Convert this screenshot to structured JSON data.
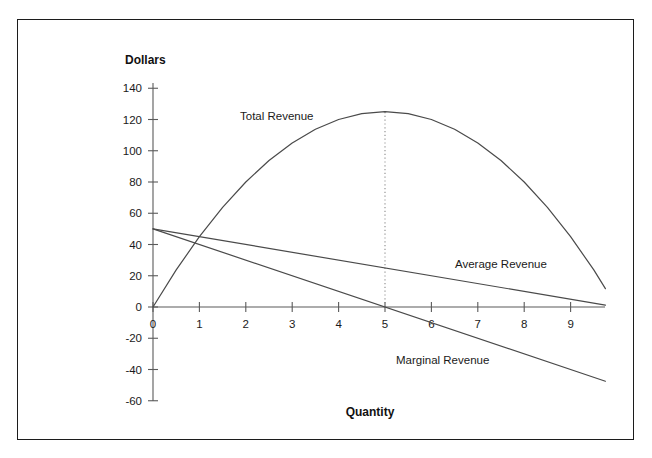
{
  "chart_data": {
    "type": "line",
    "title": "",
    "xlabel": "Quantity",
    "ylabel": "Dollars",
    "xlim": [
      0,
      9.75
    ],
    "ylim": [
      -60,
      140
    ],
    "grid": false,
    "legend_position": "inline-labels",
    "x_ticks": [
      "0",
      "1",
      "2",
      "3",
      "4",
      "5",
      "6",
      "7",
      "8",
      "9"
    ],
    "x_tick_values": [
      0,
      1,
      2,
      3,
      4,
      5,
      6,
      7,
      8,
      9
    ],
    "y_ticks": [
      "-60",
      "-40",
      "-20",
      "0",
      "20",
      "40",
      "60",
      "80",
      "100",
      "120",
      "140"
    ],
    "y_tick_values": [
      -60,
      -40,
      -20,
      0,
      20,
      40,
      60,
      80,
      100,
      120,
      140
    ],
    "series": [
      {
        "name": "Total Revenue",
        "label": "Total Revenue",
        "formula": "TR = 50Q - 5Q^2",
        "x": [
          0,
          0.5,
          1,
          1.5,
          2,
          2.5,
          3,
          3.5,
          4,
          4.5,
          5,
          5.5,
          6,
          6.5,
          7,
          7.5,
          8,
          8.5,
          9,
          9.5,
          9.75
        ],
        "values": [
          0,
          23.75,
          45,
          63.75,
          80,
          93.75,
          105,
          113.75,
          120,
          123.75,
          125,
          123.75,
          120,
          113.75,
          105,
          93.75,
          80,
          63.75,
          45,
          23.75,
          11.72
        ]
      },
      {
        "name": "Average Revenue",
        "label": "Average Revenue",
        "formula": "AR = 50 - 5Q",
        "x": [
          0,
          9.75
        ],
        "values": [
          50,
          1.25
        ]
      },
      {
        "name": "Marginal Revenue",
        "label": "Marginal Revenue",
        "formula": "MR = 50 - 10Q",
        "x": [
          0,
          9.75
        ],
        "values": [
          50,
          -47.5
        ]
      }
    ],
    "annotations": [
      {
        "name": "peak-guideline",
        "type": "vertical-dotted-line",
        "x": 5,
        "y_from": 0,
        "y_to": 125
      }
    ],
    "peak": {
      "x": 5,
      "y": 125
    },
    "mr_zero_crossing": {
      "x": 5,
      "y": 0
    },
    "colors": {
      "curve": "#4a4a4a",
      "axis": "#5a5a5a",
      "guide": "#8a8a8a",
      "frame": "#1c1c1c",
      "text": "#1a1a1a",
      "background": "#ffffff"
    }
  },
  "labels": {
    "y_axis_title": "Dollars",
    "x_axis_title": "Quantity",
    "total_revenue": "Total Revenue",
    "average_revenue": "Average Revenue",
    "marginal_revenue": "Marginal Revenue"
  }
}
